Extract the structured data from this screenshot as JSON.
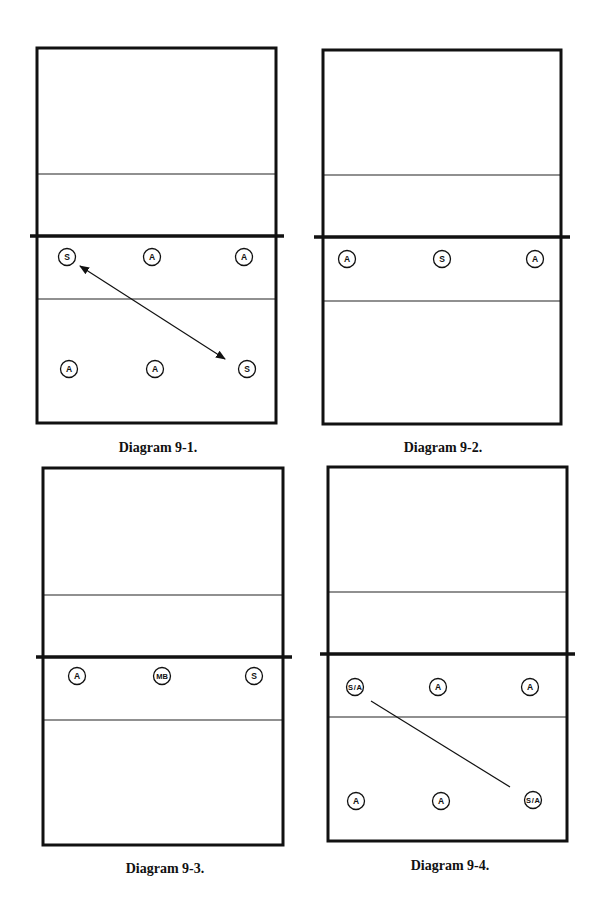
{
  "diagrams": [
    {
      "caption": "Diagram 9-1.",
      "court": {
        "x1": 37,
        "y1": 48,
        "x2": 276,
        "y2": 423
      },
      "attack_lines": [
        174,
        299
      ],
      "net": {
        "y": 236,
        "x1": 30,
        "x2": 284
      },
      "players": [
        {
          "label": "S",
          "x": 67,
          "y": 257
        },
        {
          "label": "A",
          "x": 152,
          "y": 257
        },
        {
          "label": "A",
          "x": 244,
          "y": 257
        },
        {
          "label": "A",
          "x": 69,
          "y": 369
        },
        {
          "label": "A",
          "x": 155,
          "y": 369
        },
        {
          "label": "S",
          "x": 247,
          "y": 369
        }
      ],
      "lines": [
        {
          "x1": 80,
          "y1": 266,
          "x2": 225,
          "y2": 359,
          "arrow": "both"
        }
      ],
      "caption_pos": {
        "x": 158,
        "y": 440
      }
    },
    {
      "caption": "Diagram 9-2.",
      "court": {
        "x1": 323,
        "y1": 50,
        "x2": 561,
        "y2": 424
      },
      "attack_lines": [
        175,
        301
      ],
      "net": {
        "y": 237,
        "x1": 314,
        "x2": 570
      },
      "players": [
        {
          "label": "A",
          "x": 347,
          "y": 259
        },
        {
          "label": "S",
          "x": 442,
          "y": 259
        },
        {
          "label": "A",
          "x": 535,
          "y": 259
        }
      ],
      "lines": [],
      "caption_pos": {
        "x": 443,
        "y": 440
      }
    },
    {
      "caption": "Diagram 9-3.",
      "court": {
        "x1": 43,
        "y1": 468,
        "x2": 283,
        "y2": 845
      },
      "attack_lines": [
        595,
        720
      ],
      "net": {
        "y": 657,
        "x1": 36,
        "x2": 292
      },
      "players": [
        {
          "label": "A",
          "x": 77,
          "y": 676
        },
        {
          "label": "MB",
          "x": 162,
          "y": 676
        },
        {
          "label": "S",
          "x": 254,
          "y": 676
        }
      ],
      "lines": [],
      "caption_pos": {
        "x": 165,
        "y": 861
      }
    },
    {
      "caption": "Diagram 9-4.",
      "court": {
        "x1": 328,
        "y1": 467,
        "x2": 567,
        "y2": 841
      },
      "attack_lines": [
        592,
        717
      ],
      "net": {
        "y": 654,
        "x1": 320,
        "x2": 575
      },
      "players": [
        {
          "label": "S/A",
          "x": 355,
          "y": 687
        },
        {
          "label": "A",
          "x": 438,
          "y": 687
        },
        {
          "label": "A",
          "x": 530,
          "y": 687
        },
        {
          "label": "A",
          "x": 356,
          "y": 801
        },
        {
          "label": "A",
          "x": 441,
          "y": 801
        },
        {
          "label": "S/A",
          "x": 533,
          "y": 800
        }
      ],
      "lines": [
        {
          "x1": 371,
          "y1": 701,
          "x2": 510,
          "y2": 787,
          "arrow": "none"
        }
      ],
      "caption_pos": {
        "x": 450,
        "y": 858
      }
    }
  ],
  "colors": {
    "ink": "#111111",
    "background": "#ffffff"
  }
}
